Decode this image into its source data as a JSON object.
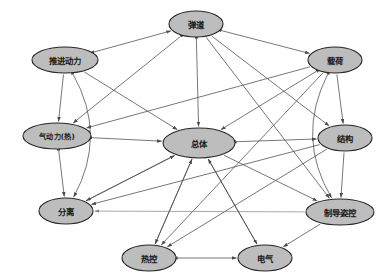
{
  "diagram": {
    "type": "directed-graph",
    "title": "",
    "background_color": "#ffffff",
    "node_fill_color": "#bdbdbd",
    "node_stroke_color": "#262626",
    "edge_color": "#4a4a4a",
    "nodes": [
      {
        "id": "dandao",
        "label": "弹道",
        "cx": 196,
        "cy": 24,
        "rx": 27,
        "ry": 13
      },
      {
        "id": "tuijin",
        "label": "推进动力",
        "cx": 65,
        "cy": 60,
        "rx": 33,
        "ry": 13
      },
      {
        "id": "zaihe",
        "label": "载荷",
        "cx": 335,
        "cy": 60,
        "rx": 27,
        "ry": 13
      },
      {
        "id": "qidongli",
        "label": "气动力(热)",
        "cx": 57,
        "cy": 136,
        "rx": 34,
        "ry": 13
      },
      {
        "id": "zongti",
        "label": "总体",
        "cx": 199,
        "cy": 143,
        "rx": 36,
        "ry": 15
      },
      {
        "id": "jiegou",
        "label": "结构",
        "cx": 345,
        "cy": 138,
        "rx": 27,
        "ry": 13
      },
      {
        "id": "fenli",
        "label": "分离",
        "cx": 66,
        "cy": 211,
        "rx": 27,
        "ry": 13
      },
      {
        "id": "zhidao",
        "label": "制导姿控",
        "cx": 340,
        "cy": 212,
        "rx": 34,
        "ry": 13
      },
      {
        "id": "rekong",
        "label": "热控",
        "cx": 149,
        "cy": 258,
        "rx": 27,
        "ry": 13
      },
      {
        "id": "dianqi",
        "label": "电气",
        "cx": 265,
        "cy": 258,
        "rx": 27,
        "ry": 13
      }
    ],
    "edges": [
      {
        "from": "tuijin",
        "to": "dandao",
        "arrow": "both"
      },
      {
        "from": "dandao",
        "to": "zaihe",
        "arrow": "both"
      },
      {
        "from": "dandao",
        "to": "zongti",
        "arrow": "both"
      },
      {
        "from": "dandao",
        "to": "qidongli",
        "arrow": "both"
      },
      {
        "from": "dandao",
        "to": "jiegou",
        "arrow": "forward"
      },
      {
        "from": "dandao",
        "to": "zhidao",
        "arrow": "forward"
      },
      {
        "from": "tuijin",
        "to": "zongti",
        "arrow": "forward"
      },
      {
        "from": "tuijin",
        "to": "qidongli",
        "arrow": "forward"
      },
      {
        "from": "tuijin",
        "to": "fenli",
        "arrow": "both",
        "curve": "left"
      },
      {
        "from": "zaihe",
        "to": "zongti",
        "arrow": "both"
      },
      {
        "from": "zaihe",
        "to": "jiegou",
        "arrow": "forward"
      },
      {
        "from": "zaihe",
        "to": "zhidao",
        "arrow": "both",
        "curve": "right"
      },
      {
        "from": "zaihe",
        "to": "qidongli",
        "arrow": "forward"
      },
      {
        "from": "zaihe",
        "to": "rekong",
        "arrow": "forward"
      },
      {
        "from": "qidongli",
        "to": "zongti",
        "arrow": "both"
      },
      {
        "from": "qidongli",
        "to": "fenli",
        "arrow": "both"
      },
      {
        "from": "zongti",
        "to": "jiegou",
        "arrow": "both"
      },
      {
        "from": "zongti",
        "to": "fenli",
        "arrow": "forward"
      },
      {
        "from": "zongti",
        "to": "rekong",
        "arrow": "forward"
      },
      {
        "from": "zongti",
        "to": "dianqi",
        "arrow": "forward"
      },
      {
        "from": "zongti",
        "to": "zhidao",
        "arrow": "forward"
      },
      {
        "from": "jiegou",
        "to": "zhidao",
        "arrow": "forward"
      },
      {
        "from": "jiegou",
        "to": "rekong",
        "arrow": "forward"
      },
      {
        "from": "jiegou",
        "to": "fenli",
        "arrow": "forward"
      },
      {
        "from": "zhidao",
        "to": "fenli",
        "arrow": "forward",
        "style": "light"
      },
      {
        "from": "zhidao",
        "to": "dianqi",
        "arrow": "forward"
      },
      {
        "from": "rekong",
        "to": "dianqi",
        "arrow": "both"
      },
      {
        "from": "rekong",
        "to": "zongti",
        "arrow": "forward"
      },
      {
        "from": "fenli",
        "to": "zongti",
        "arrow": "forward"
      },
      {
        "from": "dianqi",
        "to": "zongti",
        "arrow": "forward"
      }
    ]
  }
}
